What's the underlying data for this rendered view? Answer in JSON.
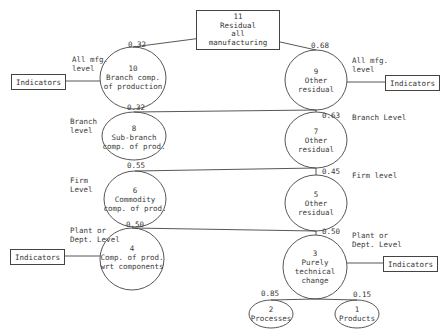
{
  "root": {
    "number": "11",
    "line1": "Residual",
    "line2": "all",
    "line3": "manufacturing"
  },
  "indicator_label": "Indicators",
  "levels": {
    "all_left": [
      "All mfg.",
      "level"
    ],
    "all_right": [
      "All mfg.",
      "level"
    ],
    "branch_left": [
      "Branch",
      "level"
    ],
    "branch_right": "Branch Level",
    "firm_left": [
      "Firm",
      "Level"
    ],
    "firm_right": "Firm level",
    "plant_left": [
      "Plant or",
      "Dept. Level"
    ],
    "plant_right": [
      "Plant or",
      "Dept. Level"
    ]
  },
  "nodes": {
    "n10": {
      "number": "10",
      "l1": "Branch comp.",
      "l2": "of production",
      "weight": "0.32"
    },
    "n9": {
      "number": "9",
      "l1": "Other",
      "l2": "residual",
      "weight": "0.68"
    },
    "n8": {
      "number": "8",
      "l1": "Sub-branch",
      "l2": "comp. of prod.",
      "weight": "0.32"
    },
    "n7": {
      "number": "7",
      "l1": "Other",
      "l2": "residual",
      "weight": "0.63"
    },
    "n6": {
      "number": "6",
      "l1": "Commodity",
      "l2": "comp. of prod.",
      "weight": "0.55"
    },
    "n5": {
      "number": "5",
      "l1": "Other",
      "l2": "residual",
      "weight": "0.45"
    },
    "n4": {
      "number": "4",
      "l1": "Comp. of prod.",
      "l2": "wrt components",
      "weight": "0.50"
    },
    "n3": {
      "number": "3",
      "l1": "Purely",
      "l2": "technical",
      "l3": "change",
      "weight": "0.50"
    },
    "n2": {
      "number": "2",
      "l1": "Processes",
      "weight": "0.85"
    },
    "n1": {
      "number": "1",
      "l1": "Products",
      "weight": "0.15"
    }
  }
}
